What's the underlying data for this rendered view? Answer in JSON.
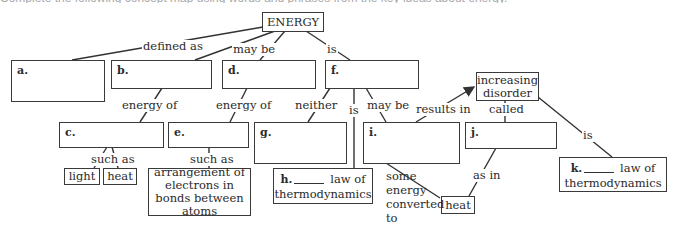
{
  "header_fragment": "Complete the following concept map using words and phrases from the key ideas about energy.",
  "root": {
    "label": "ENERGY"
  },
  "nodes": {
    "a": {
      "letter": "a.",
      "text": ""
    },
    "b": {
      "letter": "b.",
      "text": ""
    },
    "c": {
      "letter": "c.",
      "text": ""
    },
    "d": {
      "letter": "d.",
      "text": ""
    },
    "e": {
      "letter": "e.",
      "text": ""
    },
    "f": {
      "letter": "f.",
      "text": ""
    },
    "g": {
      "letter": "g.",
      "text": ""
    },
    "h": {
      "letter": "h.",
      "suffix": "law of",
      "line2": "thermodynamics"
    },
    "i": {
      "letter": "i.",
      "text": ""
    },
    "j": {
      "letter": "j.",
      "text": ""
    },
    "k": {
      "letter": "k.",
      "suffix": "law of",
      "line2": "thermodynamics"
    },
    "light": "light",
    "heat_c": "heat",
    "arrangement": "arrangement of electrons in bonds between atoms",
    "increasing_disorder": "increasing disorder",
    "heat_i": "heat"
  },
  "link_labels": {
    "defined_as": "defined as",
    "may_be_top": "may be",
    "is_top": "is",
    "energy_of_b": "energy of",
    "energy_of_d": "energy of",
    "such_as_c": "such as",
    "such_as_e": "such as",
    "neither": "neither",
    "is_h": "is",
    "may_be_i": "may be",
    "results_in": "results in",
    "called": "called",
    "is_k": "is",
    "some_energy": "some energy converted to",
    "as_in": "as in"
  }
}
